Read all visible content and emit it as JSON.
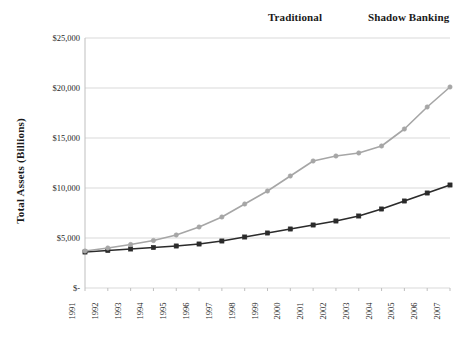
{
  "chart_data": {
    "type": "line",
    "title": "",
    "xlabel": "",
    "ylabel": "Total Assets (Billions)",
    "categories": [
      "1991",
      "1992",
      "1993",
      "1994",
      "1995",
      "1996",
      "1997",
      "1998",
      "1999",
      "2000",
      "2001",
      "2002",
      "2003",
      "2004",
      "2005",
      "2006",
      "2007"
    ],
    "series": [
      {
        "name": "Traditional",
        "color": "#2b2b2b",
        "marker": "square",
        "values": [
          3600,
          3750,
          3900,
          4050,
          4200,
          4400,
          4700,
          5100,
          5500,
          5900,
          6300,
          6700,
          7200,
          7900,
          8700,
          9500,
          10300
        ]
      },
      {
        "name": "Shadow Banking",
        "color": "#a6a6a6",
        "marker": "circle",
        "values": [
          3700,
          4000,
          4350,
          4750,
          5300,
          6100,
          7100,
          8400,
          9700,
          11200,
          12700,
          13200,
          13500,
          14200,
          15900,
          18100,
          20100
        ]
      }
    ],
    "ylim": [
      0,
      25000
    ],
    "ytick_values": [
      0,
      5000,
      10000,
      15000,
      20000,
      25000
    ],
    "ytick_labels": [
      "$-",
      "$5,000",
      "$10,000",
      "$15,000",
      "$20,000",
      "$25,000"
    ],
    "grid": "horizontal",
    "legend_position": "top-right"
  },
  "legend": {
    "entries": [
      {
        "label": "Traditional"
      },
      {
        "label": "Shadow Banking"
      }
    ]
  },
  "axes": {
    "y_title": "Total Assets (Billions)"
  },
  "colors": {
    "traditional": "#2b2b2b",
    "shadow_banking": "#a6a6a6",
    "gridline": "#d9d9d9",
    "axis": "#bfbfbf",
    "text": "#1a1a1a",
    "background": "#ffffff"
  }
}
